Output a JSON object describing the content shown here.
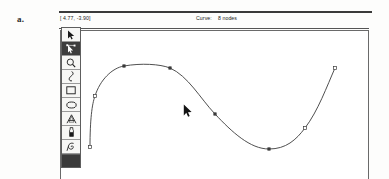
{
  "figure": {
    "label": "a."
  },
  "status_bar": {
    "coordinates": "[ 4.77, -3.90]",
    "object_kind": "Curve:",
    "object_detail": "8 nodes"
  },
  "toolbar": {
    "items": [
      {
        "name": "selector-tool",
        "icon": "arrow-pointer-icon",
        "selected": false
      },
      {
        "name": "node-edit-tool",
        "icon": "node-edit-icon",
        "selected": true
      },
      {
        "name": "zoom-tool",
        "icon": "magnifier-icon",
        "selected": false
      },
      {
        "name": "pen-tool",
        "icon": "pen-nib-icon",
        "selected": false
      },
      {
        "name": "rectangle-tool",
        "icon": "rectangle-icon",
        "selected": false
      },
      {
        "name": "ellipse-tool",
        "icon": "ellipse-icon",
        "selected": false
      },
      {
        "name": "text-tool",
        "icon": "letter-a-icon",
        "selected": false
      },
      {
        "name": "dropper-tool",
        "icon": "dropper-icon",
        "selected": false
      },
      {
        "name": "spiral-tool",
        "icon": "spiral-icon",
        "selected": false
      }
    ],
    "color_swatch": {
      "name": "fill-color-swatch",
      "color": "#3a3a3a"
    }
  },
  "canvas": {
    "cursor": {
      "icon": "arrow-cursor",
      "x": 183,
      "y": 104
    },
    "curve": {
      "stroke_color": "#3b3b3b",
      "stroke_width": 0.9,
      "node_count": 8,
      "path": "M 90 147 C 90 120 92 104 95 96 C 100 80 112 68 124 66 C 141 63 160 64 170 68 C 188 76 200 98 215 114 C 232 132 250 149 269 149 C 286 149 296 140 305 128 C 318 111 327 86 335 68",
      "nodes": [
        {
          "x": 90,
          "y": 147,
          "style": "endpoint-hollow"
        },
        {
          "x": 95,
          "y": 96,
          "style": "node-hollow"
        },
        {
          "x": 124,
          "y": 66,
          "style": "node-filled"
        },
        {
          "x": 170,
          "y": 68,
          "style": "node-filled"
        },
        {
          "x": 215,
          "y": 114,
          "style": "node-filled"
        },
        {
          "x": 269,
          "y": 149,
          "style": "node-filled"
        },
        {
          "x": 305,
          "y": 128,
          "style": "node-hollow"
        },
        {
          "x": 335,
          "y": 68,
          "style": "endpoint-hollow"
        }
      ]
    }
  }
}
